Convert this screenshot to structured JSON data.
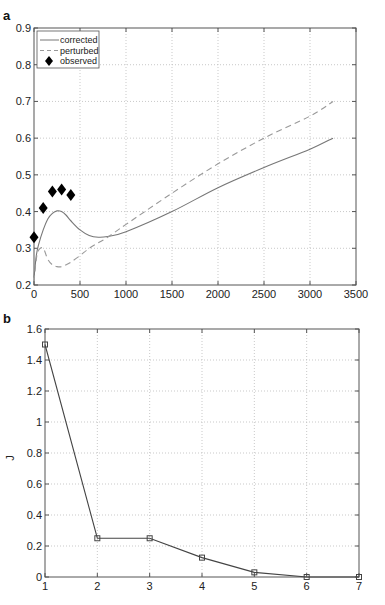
{
  "chart_data": [
    {
      "panel_label": "a",
      "type": "line",
      "title": "",
      "xlabel": "",
      "ylabel": "",
      "xlim": [
        0,
        3500
      ],
      "ylim": [
        0.2,
        0.9
      ],
      "xticks": [
        "0",
        "500",
        "1000",
        "1500",
        "2000",
        "2500",
        "3000",
        "3500"
      ],
      "yticks": [
        "0.2",
        "0.3",
        "0.4",
        "0.5",
        "0.6",
        "0.7",
        "0.8",
        "0.9"
      ],
      "grid": true,
      "legend_position": "upper left",
      "legend": [
        "corrected",
        "perturbed",
        "observed"
      ],
      "series": [
        {
          "name": "corrected",
          "style": "solid",
          "color": "#777777",
          "x": [
            0,
            25,
            50,
            100,
            150,
            200,
            250,
            300,
            350,
            400,
            500,
            600,
            700,
            800,
            1000,
            1500,
            2000,
            2500,
            3000,
            3250
          ],
          "y": [
            0.22,
            0.28,
            0.31,
            0.35,
            0.38,
            0.395,
            0.402,
            0.4,
            0.39,
            0.375,
            0.35,
            0.335,
            0.33,
            0.332,
            0.345,
            0.4,
            0.465,
            0.52,
            0.57,
            0.6
          ]
        },
        {
          "name": "perturbed",
          "style": "dashed",
          "color": "#999999",
          "x": [
            0,
            25,
            50,
            100,
            150,
            200,
            250,
            300,
            350,
            400,
            500,
            600,
            700,
            800,
            1000,
            1500,
            2000,
            2500,
            3000,
            3250
          ],
          "y": [
            0.21,
            0.27,
            0.295,
            0.3,
            0.27,
            0.255,
            0.25,
            0.25,
            0.255,
            0.262,
            0.28,
            0.3,
            0.315,
            0.33,
            0.365,
            0.45,
            0.53,
            0.6,
            0.66,
            0.7
          ]
        },
        {
          "name": "observed",
          "style": "markers",
          "marker": "diamond",
          "color": "#000000",
          "x": [
            0,
            100,
            200,
            300,
            400
          ],
          "y": [
            0.33,
            0.41,
            0.455,
            0.46,
            0.445
          ]
        }
      ]
    },
    {
      "panel_label": "b",
      "type": "line",
      "title": "",
      "xlabel": "",
      "ylabel": "J",
      "xlim": [
        1,
        7
      ],
      "ylim": [
        0,
        1.6
      ],
      "xticks": [
        "1",
        "2",
        "3",
        "4",
        "5",
        "6",
        "7"
      ],
      "yticks": [
        "0",
        "0.2",
        "0.4",
        "0.6",
        "0.8",
        "1",
        "1.2",
        "1.4",
        "1.6"
      ],
      "grid": true,
      "series": [
        {
          "name": "J",
          "style": "solid",
          "marker": "square",
          "color": "#444444",
          "x": [
            1,
            2,
            3,
            4,
            5,
            6,
            7
          ],
          "y": [
            1.5,
            0.25,
            0.25,
            0.125,
            0.03,
            0.0,
            0.0
          ]
        }
      ]
    }
  ]
}
